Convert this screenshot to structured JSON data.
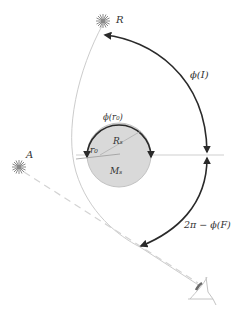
{
  "labels": {
    "source_R": "R",
    "source_A": "A",
    "phi_I": "ϕ(I)",
    "phi_r0": "ϕ(r₀)",
    "radius_Rs": "Rₛ",
    "mass_Ms": "Mₛ",
    "r0": "r₀",
    "two_pi_minus_phi_F": "2π − ϕ(F)"
  },
  "colors": {
    "background": "#ffffff",
    "planet_fill": "#d9d9d9",
    "planet_edge": "#bdbdbd",
    "dark_arc": "#2a2a2a",
    "light_path": "#c8c8c8",
    "dashed_line": "#d0d0d0",
    "star": "#8a8a8a",
    "text": "#333333"
  },
  "geometry": {
    "planet_center": [
      119,
      155
    ],
    "planet_radius": 32,
    "star_R": [
      103,
      21
    ],
    "star_A": [
      19,
      167
    ],
    "observer_eye": [
      205,
      291
    ]
  }
}
